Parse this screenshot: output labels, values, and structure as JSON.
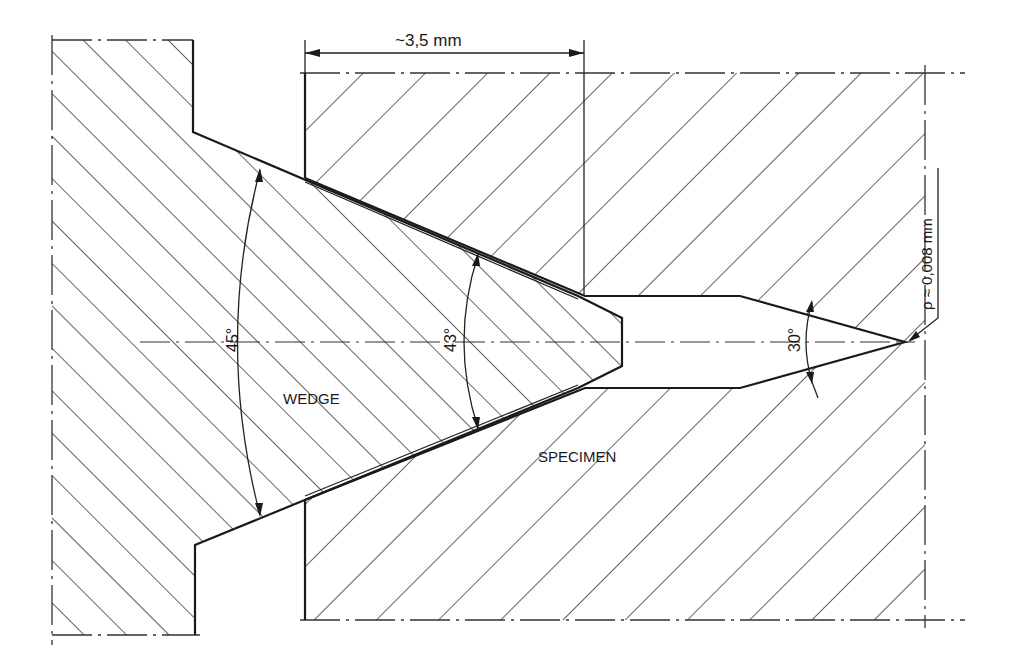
{
  "figure": {
    "type": "technical-cross-section",
    "labels": {
      "wedge": "WEDGE",
      "specimen": "SPECIMEN"
    },
    "dimensions": {
      "wedge_distance": "~3,5 mm",
      "notch_radius": "ρ ≈ 0,008 mm"
    },
    "angles": {
      "wedge_outer": "45°",
      "wedge_inner": "43°",
      "notch_tip": "30°"
    },
    "colors": {
      "line": "#1a1a1a",
      "background": "#ffffff"
    }
  }
}
